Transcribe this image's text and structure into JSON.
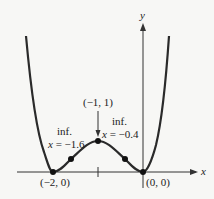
{
  "axes": {
    "x_label": "x",
    "y_label": "y"
  },
  "points": {
    "left_min": "(−2, 0)",
    "origin": "(0, 0)",
    "max": "(−1, 1)"
  },
  "inflection_left": {
    "title": "inf.",
    "var": "x",
    "value": " = −1.6"
  },
  "inflection_right": {
    "title": "inf.",
    "var": "x",
    "value": " = −0.4"
  },
  "colors": {
    "curve": "#2a2a2a",
    "axis": "#333333",
    "background": "#f7f7f5"
  }
}
